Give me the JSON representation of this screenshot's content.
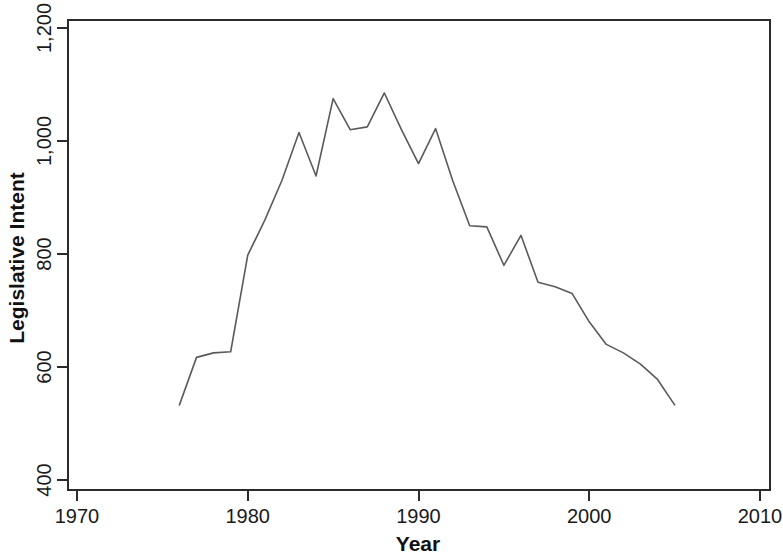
{
  "chart_data": {
    "type": "line",
    "title": "",
    "xlabel": "Year",
    "ylabel": "Legislative Intent",
    "xlim": [
      1970,
      2010
    ],
    "ylim": [
      400,
      1200
    ],
    "xticks": [
      1970,
      1980,
      1990,
      2000,
      2010
    ],
    "xtick_labels": [
      "1970",
      "1980",
      "1990",
      "2000",
      "2010"
    ],
    "yticks": [
      400,
      600,
      800,
      1000,
      1200
    ],
    "ytick_labels": [
      "400",
      "600",
      "800",
      "1,000",
      "1,200"
    ],
    "grid": false,
    "legend": null,
    "line_color": "#5a5a5a",
    "axis_color": "#2b2b2b",
    "background_color": "#ffffff",
    "x": [
      1976,
      1977,
      1978,
      1979,
      1980,
      1981,
      1982,
      1983,
      1984,
      1985,
      1986,
      1987,
      1988,
      1989,
      1990,
      1991,
      1992,
      1993,
      1994,
      1995,
      1996,
      1997,
      1998,
      1999,
      2000,
      2001,
      2002,
      2003,
      2004,
      2005
    ],
    "values": [
      533,
      617,
      625,
      627,
      798,
      860,
      930,
      1015,
      938,
      1075,
      1020,
      1025,
      1085,
      1020,
      960,
      1022,
      930,
      850,
      848,
      780,
      833,
      750,
      742,
      730,
      680,
      640,
      625,
      605,
      578,
      533
    ],
    "series": [
      {
        "name": "Legislative Intent",
        "values": [
          533,
          617,
          625,
          627,
          798,
          860,
          930,
          1015,
          938,
          1075,
          1020,
          1025,
          1085,
          1020,
          960,
          1022,
          930,
          850,
          848,
          780,
          833,
          750,
          742,
          730,
          680,
          640,
          625,
          605,
          578,
          533
        ]
      }
    ]
  },
  "axis_labels": {
    "x": "Year",
    "y": "Legislative Intent"
  }
}
